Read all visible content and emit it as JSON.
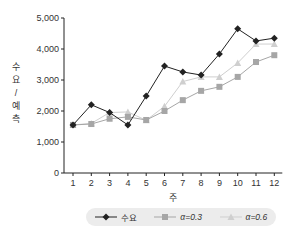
{
  "chart_data": {
    "type": "line",
    "title": "",
    "xlabel": "주",
    "ylabel": "수요 / 예측",
    "x": [
      1,
      2,
      3,
      4,
      5,
      6,
      7,
      8,
      9,
      10,
      11,
      12
    ],
    "ylim": [
      0,
      5000
    ],
    "yticks": [
      0,
      1000,
      2000,
      3000,
      4000,
      5000
    ],
    "ytick_labels": [
      "0",
      "1,000",
      "2,000",
      "3,000",
      "4,000",
      "5,000"
    ],
    "grid": false,
    "legend_position": "bottom",
    "series": [
      {
        "name": "수요",
        "color": "#222222",
        "marker": "diamond",
        "values": [
          1550,
          2200,
          1950,
          1550,
          2480,
          3450,
          3260,
          3160,
          3840,
          4650,
          4260,
          4350
        ]
      },
      {
        "name": "α=0.3",
        "color": "#a6a6a6",
        "marker": "square",
        "values": [
          1550,
          1580,
          1750,
          1810,
          1710,
          2000,
          2350,
          2650,
          2780,
          3100,
          3580,
          3800
        ]
      },
      {
        "name": "α=0.6",
        "color": "#cfcfcf",
        "marker": "triangle",
        "values": [
          1550,
          1600,
          1950,
          1970,
          1700,
          2150,
          2950,
          3100,
          3100,
          3550,
          4160,
          4160
        ]
      }
    ]
  },
  "legend": {
    "items": [
      "수요",
      "α=0.3",
      "α=0.6"
    ]
  }
}
